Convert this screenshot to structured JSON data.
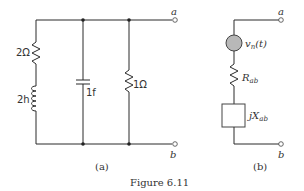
{
  "figure": {
    "caption": "Figure 6.11",
    "panel_a": {
      "label": "(a)",
      "terminals": {
        "top": "a",
        "bottom": "b"
      },
      "components": {
        "resistor_left": "2Ω",
        "inductor_left": "2h",
        "capacitor_middle": "1f",
        "resistor_right": "1Ω"
      }
    },
    "panel_b": {
      "label": "(b)",
      "terminals": {
        "top": "a",
        "bottom": "b"
      },
      "components": {
        "noise_source": {
          "main": "v",
          "subscript": "n",
          "suffix": "(t)"
        },
        "resistor": {
          "main": "R",
          "subscript": "ab"
        },
        "reactance": {
          "main": "jX",
          "subscript": "ab"
        }
      }
    }
  }
}
